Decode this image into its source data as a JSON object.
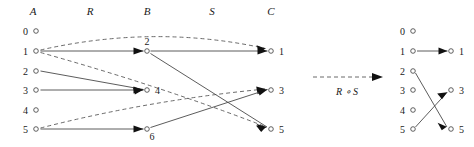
{
  "figure": {
    "title_present": false,
    "operation_label": "R ∘ S",
    "colors": {
      "edge_solid": "#4a4a4a",
      "edge_dashed": "#5a5a5a",
      "node_stroke": "#3a3a3a",
      "node_fill": "#ffffff",
      "arrowhead": "#111111",
      "text": "#1a1a1a",
      "background": "#ffffff"
    },
    "left_diagram": {
      "column_headers": [
        {
          "label": "A",
          "x": 33
        },
        {
          "label": "R",
          "x": 90
        },
        {
          "label": "B",
          "x": 147
        },
        {
          "label": "S",
          "x": 212
        },
        {
          "label": "C",
          "x": 271
        }
      ],
      "sets": {
        "A": {
          "name": "A",
          "nodes": [
            {
              "label": "0",
              "x": 36,
              "y": 31
            },
            {
              "label": "1",
              "x": 36,
              "y": 51
            },
            {
              "label": "2",
              "x": 36,
              "y": 71
            },
            {
              "label": "3",
              "x": 36,
              "y": 90
            },
            {
              "label": "4",
              "x": 36,
              "y": 110
            },
            {
              "label": "5",
              "x": 36,
              "y": 129
            }
          ]
        },
        "B": {
          "name": "B",
          "nodes": [
            {
              "label": "2",
              "x": 147,
              "y": 51
            },
            {
              "label": "4",
              "x": 147,
              "y": 90
            },
            {
              "label": "6",
              "x": 147,
              "y": 129
            }
          ]
        },
        "C": {
          "name": "C",
          "nodes": [
            {
              "label": "1",
              "x": 271,
              "y": 51
            },
            {
              "label": "3",
              "x": 271,
              "y": 90
            },
            {
              "label": "5",
              "x": 271,
              "y": 129
            }
          ]
        }
      },
      "relations": {
        "R": {
          "name": "R",
          "style": "solid",
          "from_set": "A",
          "to_set": "B",
          "pairs": [
            {
              "from": "1",
              "to": "2"
            },
            {
              "from": "2",
              "to": "4"
            },
            {
              "from": "3",
              "to": "4"
            },
            {
              "from": "5",
              "to": "6"
            }
          ]
        },
        "S": {
          "name": "S",
          "style": "solid",
          "from_set": "B",
          "to_set": "C",
          "pairs": [
            {
              "from": "2",
              "to": "1"
            },
            {
              "from": "2",
              "to": "5"
            },
            {
              "from": "6",
              "to": "3"
            }
          ]
        },
        "composition": {
          "name": "R ∘ S",
          "style": "dashed",
          "from_set": "A",
          "to_set": "C",
          "pairs": [
            {
              "from": "1",
              "to": "1"
            },
            {
              "from": "1",
              "to": "5"
            },
            {
              "from": "5",
              "to": "3"
            }
          ]
        }
      }
    },
    "transition_arrow": {
      "label": "R ∘ S",
      "style": "dashed",
      "x1": 313,
      "x2": 382,
      "y": 77,
      "label_x": 347,
      "label_y": 95
    },
    "right_diagram": {
      "title": "R ∘ S",
      "domain": {
        "name": "domain",
        "nodes": [
          {
            "label": "0",
            "x": 413,
            "y": 31
          },
          {
            "label": "1",
            "x": 413,
            "y": 51
          },
          {
            "label": "2",
            "x": 413,
            "y": 71
          },
          {
            "label": "3",
            "x": 413,
            "y": 90
          },
          {
            "label": "4",
            "x": 413,
            "y": 110
          },
          {
            "label": "5",
            "x": 413,
            "y": 129
          }
        ]
      },
      "codomain": {
        "name": "codomain",
        "nodes": [
          {
            "label": "1",
            "x": 451,
            "y": 51
          },
          {
            "label": "3",
            "x": 451,
            "y": 90
          },
          {
            "label": "5",
            "x": 451,
            "y": 129
          }
        ]
      },
      "relation": {
        "name": "R ∘ S",
        "style": "solid",
        "pairs": [
          {
            "from": "1",
            "to": "1"
          },
          {
            "from": "2",
            "to": "5"
          },
          {
            "from": "5",
            "to": "3"
          }
        ]
      }
    }
  }
}
